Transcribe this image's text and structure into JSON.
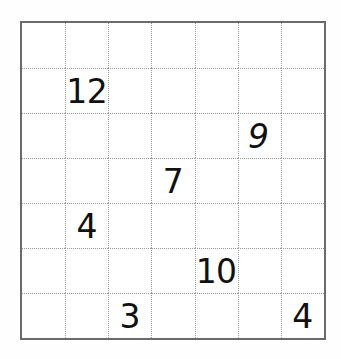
{
  "puzzle": {
    "title": "Number Grid Puzzle",
    "grid": {
      "rows": 7,
      "columns": 7,
      "border_color": "#6b6b6b",
      "gridline_color": "#9a9a9a",
      "gridline_style": "dotted",
      "cell_background": "#ffffff",
      "page_background": "#fefefe",
      "text_color": "#111111"
    },
    "cells": [
      [
        {
          "value": "",
          "style": "normal"
        },
        {
          "value": "",
          "style": "normal"
        },
        {
          "value": "",
          "style": "normal"
        },
        {
          "value": "",
          "style": "normal"
        },
        {
          "value": "",
          "style": "normal"
        },
        {
          "value": "",
          "style": "normal"
        },
        {
          "value": "",
          "style": "normal"
        }
      ],
      [
        {
          "value": "",
          "style": "normal"
        },
        {
          "value": "12",
          "style": "normal"
        },
        {
          "value": "",
          "style": "normal"
        },
        {
          "value": "",
          "style": "normal"
        },
        {
          "value": "",
          "style": "normal"
        },
        {
          "value": "",
          "style": "normal"
        },
        {
          "value": "",
          "style": "normal"
        }
      ],
      [
        {
          "value": "",
          "style": "normal"
        },
        {
          "value": "",
          "style": "normal"
        },
        {
          "value": "",
          "style": "normal"
        },
        {
          "value": "",
          "style": "normal"
        },
        {
          "value": "",
          "style": "normal"
        },
        {
          "value": "9",
          "style": "italic"
        },
        {
          "value": "",
          "style": "normal"
        }
      ],
      [
        {
          "value": "",
          "style": "normal"
        },
        {
          "value": "",
          "style": "normal"
        },
        {
          "value": "",
          "style": "normal"
        },
        {
          "value": "7",
          "style": "normal"
        },
        {
          "value": "",
          "style": "normal"
        },
        {
          "value": "",
          "style": "normal"
        },
        {
          "value": "",
          "style": "normal"
        }
      ],
      [
        {
          "value": "",
          "style": "normal"
        },
        {
          "value": "4",
          "style": "normal"
        },
        {
          "value": "",
          "style": "normal"
        },
        {
          "value": "",
          "style": "normal"
        },
        {
          "value": "",
          "style": "normal"
        },
        {
          "value": "",
          "style": "normal"
        },
        {
          "value": "",
          "style": "normal"
        }
      ],
      [
        {
          "value": "",
          "style": "normal"
        },
        {
          "value": "",
          "style": "normal"
        },
        {
          "value": "",
          "style": "normal"
        },
        {
          "value": "",
          "style": "normal"
        },
        {
          "value": "10",
          "style": "normal"
        },
        {
          "value": "",
          "style": "normal"
        },
        {
          "value": "",
          "style": "normal"
        }
      ],
      [
        {
          "value": "",
          "style": "normal"
        },
        {
          "value": "",
          "style": "normal"
        },
        {
          "value": "3",
          "style": "normal"
        },
        {
          "value": "",
          "style": "normal"
        },
        {
          "value": "",
          "style": "normal"
        },
        {
          "value": "",
          "style": "normal"
        },
        {
          "value": "4",
          "style": "normal"
        }
      ]
    ]
  }
}
